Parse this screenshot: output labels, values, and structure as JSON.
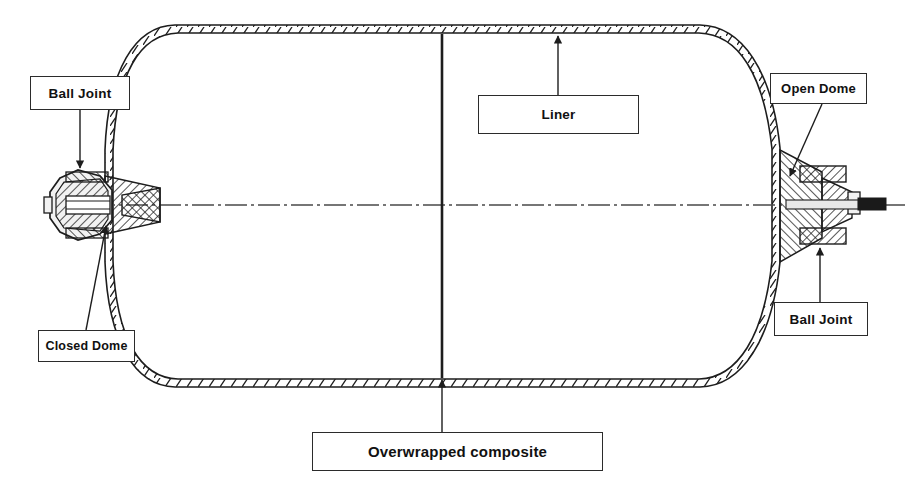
{
  "diagram": {
    "labels": [
      {
        "id": "ball-joint-left",
        "text": "Ball Joint",
        "x": 30,
        "y": 76,
        "w": 100,
        "h": 34
      },
      {
        "id": "liner",
        "text": "Liner",
        "x": 478,
        "y": 95,
        "w": 161,
        "h": 39
      },
      {
        "id": "open-dome",
        "text": "Open Dome",
        "x": 770,
        "y": 73,
        "w": 97,
        "h": 31
      },
      {
        "id": "closed-dome",
        "text": "Closed Dome",
        "x": 38,
        "y": 330,
        "w": 97,
        "h": 32
      },
      {
        "id": "ball-joint-right",
        "text": "Ball Joint",
        "x": 774,
        "y": 302,
        "w": 94,
        "h": 34
      },
      {
        "id": "overwrapped",
        "text": "Overwrapped composite",
        "x": 312,
        "y": 432,
        "w": 291,
        "h": 39
      }
    ],
    "colors": {
      "ink": "#2b2b2b",
      "line": "#1d1d1d",
      "background": "#ffffff",
      "metal_fill": "#f2f2f2",
      "shaft_fill": "#1a1a1a"
    },
    "geometry": {
      "axis_y": 205,
      "cylinder_top_y": 33,
      "cylinder_bottom_y": 376,
      "left_boss_x": 105,
      "right_boss_x": 782,
      "shaft_end_x": 886,
      "midline_x": 442
    },
    "icon_names": [
      "leader-arrow-icon",
      "centerline-axis-icon",
      "hatch-pattern-icon"
    ]
  }
}
